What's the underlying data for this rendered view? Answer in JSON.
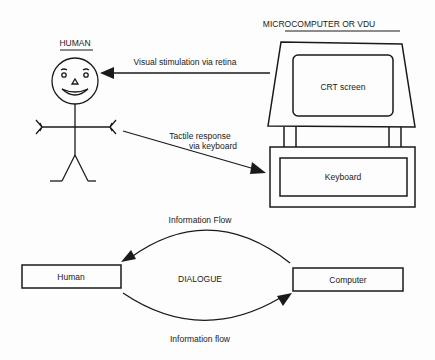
{
  "top_diagram": {
    "human_title": "HUMAN",
    "computer_title": "MICROCOMPUTER OR VDU",
    "screen_label": "CRT screen",
    "keyboard_label": "Keyboard",
    "visual_arrow_label": "Visual stimulation via retina",
    "tactile_arrow_label_line1": "Tactile response",
    "tactile_arrow_label_line2": "via keyboard"
  },
  "bottom_diagram": {
    "human_box": "Human",
    "computer_box": "Computer",
    "center_label": "DIALOGUE",
    "top_flow_label": "Information Flow",
    "bottom_flow_label": "Information flow"
  },
  "colors": {
    "ink": "#1a1a1a",
    "paper": "#fdfdfd"
  }
}
